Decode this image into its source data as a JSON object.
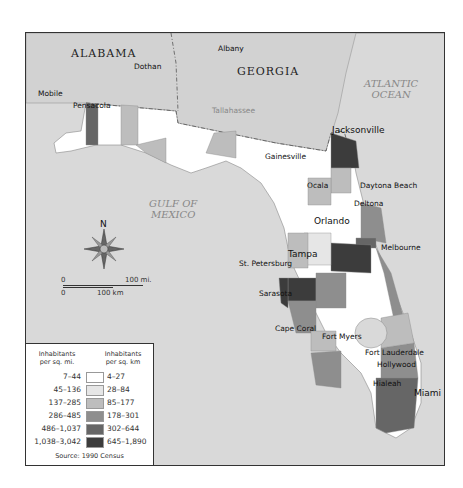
{
  "map": {
    "title": "Florida Population Density",
    "states": [
      {
        "name": "ALABAMA"
      },
      {
        "name": "GEORGIA"
      }
    ],
    "water_bodies": [
      {
        "name_line1": "ATLANTIC",
        "name_line2": "OCEAN"
      },
      {
        "name_line1": "GULF OF",
        "name_line2": "MEXICO"
      }
    ],
    "cities": [
      {
        "name": "Mobile"
      },
      {
        "name": "Pensacola"
      },
      {
        "name": "Dothan"
      },
      {
        "name": "Albany"
      },
      {
        "name": "Tallahassee"
      },
      {
        "name": "Jacksonville"
      },
      {
        "name": "Gainesville"
      },
      {
        "name": "Ocala"
      },
      {
        "name": "Daytona Beach"
      },
      {
        "name": "Deltona"
      },
      {
        "name": "Orlando"
      },
      {
        "name": "Melbourne"
      },
      {
        "name": "Tampa"
      },
      {
        "name": "St. Petersburg"
      },
      {
        "name": "Sarasota"
      },
      {
        "name": "Cape Coral"
      },
      {
        "name": "Fort Myers"
      },
      {
        "name": "Fort Lauderdale"
      },
      {
        "name": "Hollywood"
      },
      {
        "name": "Hialeah"
      },
      {
        "name": "Miami"
      }
    ],
    "compass": {
      "north_label": "N"
    },
    "scale": {
      "miles_zero": "0",
      "miles_label": "100 mi.",
      "km_zero": "0",
      "km_label": "100 km"
    }
  },
  "legend": {
    "header_mi": "Inhabitants per sq. mi.",
    "header_km": "Inhabitants per sq. km",
    "header_mi_line1": "Inhabitants",
    "header_mi_line2": "per sq. mi.",
    "header_km_line1": "Inhabitants",
    "header_km_line2": "per sq. km",
    "classes": [
      {
        "per_sq_mi": "7–44",
        "per_sq_km": "4–27",
        "color": "#ffffff"
      },
      {
        "per_sq_mi": "45–136",
        "per_sq_km": "28–84",
        "color": "#e6e6e6"
      },
      {
        "per_sq_mi": "137–285",
        "per_sq_km": "85–177",
        "color": "#bdbdbd"
      },
      {
        "per_sq_mi": "286–485",
        "per_sq_km": "178–301",
        "color": "#8e8e8e"
      },
      {
        "per_sq_mi": "486–1,037",
        "per_sq_km": "302–644",
        "color": "#666666"
      },
      {
        "per_sq_mi": "1,038–3,042",
        "per_sq_km": "645–1,890",
        "color": "#3c3c3c"
      }
    ],
    "source": "Source: 1990 Census"
  }
}
